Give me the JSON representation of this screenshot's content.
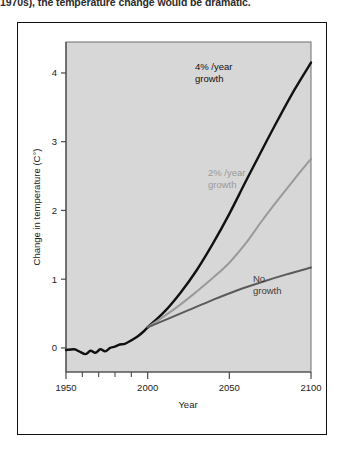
{
  "caption": {
    "text": "1970s), the temperature change would be dramatic."
  },
  "chart_data": {
    "type": "line",
    "title": "",
    "xlabel": "Year",
    "ylabel": "Change in temperature (C°)",
    "xlim": [
      1950,
      2100
    ],
    "ylim": [
      -0.35,
      4.45
    ],
    "grid": false,
    "legend_position": "inline-annotations",
    "x_ticks": [
      1950,
      2000,
      2050,
      2100
    ],
    "x_tick_labels": [
      "1950",
      "2000",
      "2050",
      "2100"
    ],
    "x_minor_ticks": [
      1960,
      1970,
      1980,
      1990,
      2010,
      2020,
      2030,
      2040,
      2060,
      2070,
      2080,
      2090
    ],
    "y_ticks": [
      0,
      1,
      2,
      3,
      4
    ],
    "y_tick_labels": [
      "0",
      "1",
      "2",
      "3",
      "4"
    ],
    "plot_background": "#d7d7d7",
    "series": [
      {
        "name": "historical",
        "label": "",
        "color": "#111111",
        "width": 2.4,
        "x": [
          1950,
          1955,
          1958,
          1962,
          1965,
          1968,
          1971,
          1974,
          1977,
          1980,
          1983,
          1986,
          1990,
          1994,
          1998,
          2000
        ],
        "values": [
          -0.03,
          -0.02,
          -0.05,
          -0.09,
          -0.04,
          -0.07,
          -0.02,
          -0.05,
          0.0,
          0.02,
          0.05,
          0.06,
          0.11,
          0.17,
          0.25,
          0.3
        ]
      },
      {
        "name": "4-percent-growth",
        "label": "4% /year\ngrowth",
        "color": "#111111",
        "width": 2.4,
        "x": [
          2000,
          2010,
          2020,
          2030,
          2040,
          2050,
          2060,
          2070,
          2080,
          2090,
          2100
        ],
        "values": [
          0.3,
          0.52,
          0.8,
          1.13,
          1.52,
          1.95,
          2.42,
          2.88,
          3.33,
          3.76,
          4.15
        ]
      },
      {
        "name": "2-percent-growth",
        "label": "2% /year\ngrowth",
        "color": "#9a9a9a",
        "width": 2.0,
        "x": [
          2000,
          2010,
          2020,
          2030,
          2040,
          2050,
          2060,
          2070,
          2080,
          2090,
          2100
        ],
        "values": [
          0.3,
          0.46,
          0.63,
          0.82,
          1.02,
          1.24,
          1.52,
          1.85,
          2.16,
          2.46,
          2.75
        ]
      },
      {
        "name": "no-growth",
        "label": "No\ngrowth",
        "color": "#5a5a5a",
        "width": 2.0,
        "x": [
          2000,
          2012,
          2025,
          2040,
          2055,
          2070,
          2085,
          2100
        ],
        "values": [
          0.3,
          0.42,
          0.55,
          0.7,
          0.84,
          0.96,
          1.07,
          1.17
        ]
      }
    ],
    "annotations": [
      {
        "name": "label-4-percent",
        "line1": "4% /year",
        "line2": "growth",
        "color": "#111111"
      },
      {
        "name": "label-2-percent",
        "line1": "2% /year",
        "line2": "growth",
        "color": "#9a9a9a"
      },
      {
        "name": "label-no-growth",
        "line1": "No",
        "line2": "growth",
        "color": "#3c3c3c"
      }
    ]
  }
}
